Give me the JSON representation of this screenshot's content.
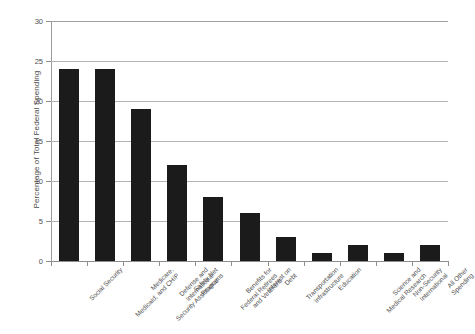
{
  "chart_data": {
    "type": "bar",
    "title": "",
    "xlabel": "",
    "ylabel": "Percentage of Total Federal Spending",
    "ylim": [
      0,
      30
    ],
    "ytick_step": 5,
    "ytick_labels": [
      "0",
      "5",
      "10",
      "15",
      "20",
      "25",
      "30"
    ],
    "grid": true,
    "legend": "none",
    "bar_color": "#1b1b1b",
    "gridline_color": "#b4b4b4",
    "axis_color": "#8e8e8e",
    "background_color": "#ffffff",
    "categories": [
      "Social Security",
      "Medicare, Medicaid, and CHIP",
      "Defense and International Security Assistance",
      "Safety Net Programs",
      "Benefits for Federal Retirees and Veterans",
      "Interest on Debt",
      "Transportation Infrastructure",
      "Education",
      "Science and Medical Research",
      "Non-Security International",
      "All Other Spending"
    ],
    "category_lines": [
      [
        "Social Security"
      ],
      [
        "Medicare,",
        "Medicaid, and CHIP"
      ],
      [
        "Defense and",
        "International",
        "Security Assistance"
      ],
      [
        "Safety Net",
        "Programs"
      ],
      [
        "Benefits for",
        "Federal Retirees",
        "and Veterans"
      ],
      [
        "Interest on",
        "Debt"
      ],
      [
        "Transportation",
        "Infrastructure"
      ],
      [
        "Education"
      ],
      [
        "Science and",
        "Medical Research"
      ],
      [
        "Non-Security",
        "International"
      ],
      [
        "All Other",
        "Spending"
      ]
    ],
    "values": [
      24,
      24,
      19,
      12,
      8,
      6,
      3,
      1,
      2,
      1,
      2
    ]
  }
}
